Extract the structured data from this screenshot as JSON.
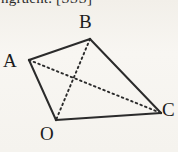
{
  "figure": {
    "caption_fragment": "ngruent. [SSS]",
    "background_color": "#f5f3ef",
    "stroke_color": "#2b2b2b",
    "canvas": {
      "width": 178,
      "height": 152
    },
    "shape_type": "quadrilateral-with-diagonals",
    "vertices": [
      {
        "name": "A",
        "label": "A",
        "x": 29,
        "y": 60,
        "label_x": 3,
        "label_y": 51
      },
      {
        "name": "B",
        "label": "B",
        "x": 90,
        "y": 39,
        "label_x": 79,
        "label_y": 12
      },
      {
        "name": "C",
        "label": "C",
        "x": 161,
        "y": 113,
        "label_x": 162,
        "label_y": 100
      },
      {
        "name": "O",
        "label": "O",
        "x": 56,
        "y": 120,
        "label_x": 40,
        "label_y": 124
      }
    ],
    "solid_edges": [
      {
        "name": "edge-AB",
        "from": "A",
        "to": "B"
      },
      {
        "name": "edge-BC",
        "from": "B",
        "to": "C"
      },
      {
        "name": "edge-CO",
        "from": "C",
        "to": "O"
      },
      {
        "name": "edge-OA",
        "from": "O",
        "to": "A"
      }
    ],
    "dashed_diagonals": [
      {
        "name": "diagonal-AC",
        "from": "A",
        "to": "C"
      },
      {
        "name": "diagonal-BO",
        "from": "B",
        "to": "O"
      }
    ],
    "intersection_point": {
      "x": 73,
      "y": 82
    }
  }
}
